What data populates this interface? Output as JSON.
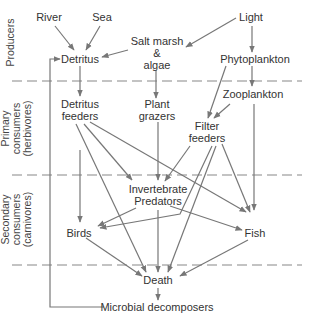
{
  "levels": [
    {
      "id": "producers",
      "lines": [
        "Producers"
      ]
    },
    {
      "id": "primary",
      "lines": [
        "Primary",
        "consumers",
        "(herbivores)"
      ]
    },
    {
      "id": "secondary",
      "lines": [
        "Secondary",
        "consumers",
        "(carnivores)"
      ]
    }
  ],
  "nodes": {
    "river": "River",
    "sea": "Sea",
    "light": "Light",
    "salt_marsh": [
      "Salt marsh",
      "&",
      "algae"
    ],
    "detritus": "Detritus",
    "phytoplankton": "Phytoplankton",
    "zooplankton": "Zooplankton",
    "detritus_feeders": [
      "Detritus",
      "feeders"
    ],
    "plant_grazers": [
      "Plant",
      "grazers"
    ],
    "filter_feeders": [
      "Filter",
      "feeders"
    ],
    "invertebrate_predators": [
      "Invertebrate",
      "Predators"
    ],
    "birds": "Birds",
    "fish": "Fish",
    "death": "Death",
    "microbial_decomposers": "Microbial decomposers"
  },
  "edges": [
    [
      "River",
      "Detritus"
    ],
    [
      "Sea",
      "Detritus"
    ],
    [
      "Light",
      "Salt marsh & algae"
    ],
    [
      "Light",
      "Phytoplankton"
    ],
    [
      "Salt marsh & algae",
      "Detritus"
    ],
    [
      "Salt marsh & algae",
      "Plant grazers"
    ],
    [
      "Detritus",
      "Detritus feeders"
    ],
    [
      "Phytoplankton",
      "Zooplankton"
    ],
    [
      "Phytoplankton",
      "Filter feeders"
    ],
    [
      "Zooplankton",
      "Filter feeders"
    ],
    [
      "Zooplankton",
      "Fish"
    ],
    [
      "Detritus feeders",
      "Invertebrate Predators"
    ],
    [
      "Detritus feeders",
      "Fish"
    ],
    [
      "Detritus feeders",
      "Death"
    ],
    [
      "Detritus feeders",
      "Birds"
    ],
    [
      "Plant grazers",
      "Invertebrate Predators"
    ],
    [
      "Filter feeders",
      "Invertebrate Predators"
    ],
    [
      "Filter feeders",
      "Birds"
    ],
    [
      "Filter feeders",
      "Death"
    ],
    [
      "Filter feeders",
      "Fish"
    ],
    [
      "Invertebrate Predators",
      "Birds"
    ],
    [
      "Invertebrate Predators",
      "Fish"
    ],
    [
      "Invertebrate Predators",
      "Death"
    ],
    [
      "Birds",
      "Death"
    ],
    [
      "Fish",
      "Death"
    ],
    [
      "Death",
      "Microbial decomposers"
    ],
    [
      "Microbial decomposers",
      "Detritus"
    ]
  ],
  "colors": {
    "line": "#777777",
    "divider": "#888888",
    "text": "#333333"
  }
}
